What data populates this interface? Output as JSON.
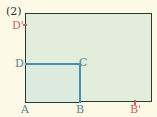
{
  "figure": {
    "number_label": "(2)",
    "points": {
      "A": "A",
      "B": "B",
      "C": "C",
      "D": "D",
      "B_prime": "B'",
      "D_prime": "D'"
    },
    "colors": {
      "outer_border": "#2b3a2e",
      "outer_fill": "#e3eddc",
      "inner_border": "#4a8fb0",
      "primed_labels": "#d06060",
      "labels": "#5a7f95"
    }
  }
}
